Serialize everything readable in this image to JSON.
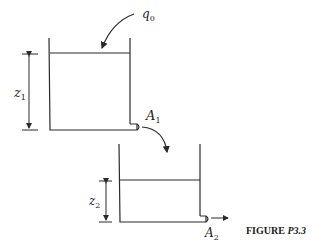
{
  "figure": {
    "caption_prefix": "FIGURE ",
    "caption_id": "P3.3"
  },
  "labels": {
    "inflow": "q",
    "inflow_sub": "0",
    "level1": "z",
    "level1_sub": "1",
    "outlet1": "A",
    "outlet1_sub": "1",
    "level2": "z",
    "level2_sub": "2",
    "outlet2": "A",
    "outlet2_sub": "2"
  },
  "colors": {
    "stroke": "#2a2a2a",
    "background": "#ffffff"
  }
}
